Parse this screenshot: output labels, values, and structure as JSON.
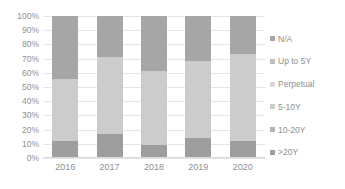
{
  "chart_data": {
    "type": "bar",
    "title": "",
    "subtitle": "",
    "xlabel": "",
    "ylabel": "",
    "stacked": true,
    "normalized_percent": true,
    "grid": true,
    "legend_position": "right",
    "ylim": [
      0,
      100
    ],
    "ytick_labels": [
      "100%",
      "90%",
      "80%",
      "70%",
      "60%",
      "50%",
      "40%",
      "30%",
      "20%",
      "10%",
      "0%"
    ],
    "ytick_values": [
      100,
      90,
      80,
      70,
      60,
      50,
      40,
      30,
      20,
      10,
      0
    ],
    "categories": [
      "2016",
      "2017",
      "2018",
      "2019",
      "2020"
    ],
    "series": [
      {
        "name": "N/A",
        "color": "#a6a6a6",
        "values": [
          44,
          29,
          39,
          32,
          27
        ]
      },
      {
        "name": "Up to 5Y",
        "color": "#bfbfbf",
        "values": [
          0,
          0,
          0,
          0,
          0
        ]
      },
      {
        "name": "Perpetual",
        "color": "#d9d9d9",
        "values": [
          0,
          0,
          0,
          0,
          0
        ]
      },
      {
        "name": "5-10Y",
        "color": "#cccccc",
        "values": [
          44,
          54,
          52,
          54,
          61
        ]
      },
      {
        "name": "10-20Y",
        "color": "#b3b3b3",
        "values": [
          0,
          0,
          0,
          0,
          0
        ]
      },
      {
        "name": ">20Y",
        "color": "#9e9e9e",
        "values": [
          12,
          17,
          9,
          14,
          12
        ]
      }
    ]
  },
  "axes": {
    "y_ticks": [
      {
        "label": "100%",
        "value": 100
      },
      {
        "label": "90%",
        "value": 90
      },
      {
        "label": "80%",
        "value": 80
      },
      {
        "label": "70%",
        "value": 70
      },
      {
        "label": "60%",
        "value": 60
      },
      {
        "label": "50%",
        "value": 50
      },
      {
        "label": "40%",
        "value": 40
      },
      {
        "label": "30%",
        "value": 30
      },
      {
        "label": "20%",
        "value": 20
      },
      {
        "label": "10%",
        "value": 10
      },
      {
        "label": "0%",
        "value": 0
      }
    ],
    "x_ticks": [
      {
        "label": "2016"
      },
      {
        "label": "2017"
      },
      {
        "label": "2018"
      },
      {
        "label": "2019"
      },
      {
        "label": "2020"
      }
    ]
  },
  "legend": {
    "items": [
      {
        "label": "N/A",
        "color": "#a6a6a6"
      },
      {
        "label": "Up to 5Y",
        "color": "#bfbfbf"
      },
      {
        "label": "Perpetual",
        "color": "#d9d9d9"
      },
      {
        "label": "5-10Y",
        "color": "#cccccc"
      },
      {
        "label": "10-20Y",
        "color": "#b3b3b3"
      },
      {
        "label": ">20Y",
        "color": "#9e9e9e"
      }
    ]
  },
  "style": {
    "background": "#ffffff",
    "gridline_color": "#e6e6e6",
    "text_color": "#8f8f8f"
  }
}
